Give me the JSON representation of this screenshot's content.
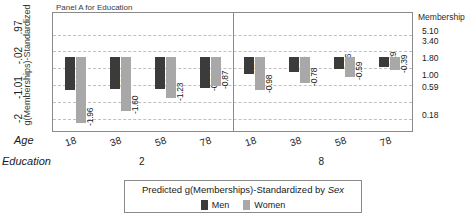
{
  "panel_title": "Panel A for Education",
  "axes": {
    "y_title": "g(Memberships)-Standardized",
    "y_ticks": [
      ".97",
      "-.02",
      "-1.01",
      "-2"
    ],
    "x_title": "Age",
    "group_title": "Education",
    "right_title": "Membership",
    "right_ticks": [
      "5.10",
      "3.40",
      "1.80",
      "1.00",
      "0.59",
      "0.18"
    ]
  },
  "legend": {
    "title_prefix": "Predicted g(Memberships)-Standardized by ",
    "title_emphasis": "Sex",
    "items": [
      {
        "label": "Men",
        "color": "#3b3b3b"
      },
      {
        "label": "Women",
        "color": "#a8a8a8"
      }
    ]
  },
  "chart_data": {
    "type": "bar",
    "title": "Panel A for Education",
    "xlabel": "Age",
    "ylabel": "g(Memberships)-Standardized",
    "ylim": [
      -2.2,
      1.3
    ],
    "grid": true,
    "legend_position": "bottom",
    "ytick_values": [
      0.97,
      -0.02,
      -1.01,
      -2
    ],
    "secondary_axis": {
      "label": "Membership",
      "ticks": [
        5.1,
        3.4,
        1.8,
        1.0,
        0.59,
        0.18
      ]
    },
    "groups": [
      "Education 2",
      "Education 8"
    ],
    "categories": [
      "18",
      "38",
      "58",
      "78"
    ],
    "series": [
      {
        "name": "Men",
        "color": "#3b3b3b",
        "values_by_group": [
          [
            -0.99,
            -0.96,
            -0.94,
            -0.91
          ],
          [
            -0.51,
            -0.44,
            -0.36,
            -0.29
          ]
        ]
      },
      {
        "name": "Women",
        "color": "#a8a8a8",
        "values_by_group": [
          [
            -1.96,
            -1.6,
            -1.23,
            -0.87
          ],
          [
            -0.98,
            -0.78,
            -0.59,
            -0.39
          ]
        ]
      }
    ],
    "bars": [
      {
        "group": "Education 2",
        "age": "18",
        "sex": "Men",
        "value": -0.99,
        "label": "-0.99"
      },
      {
        "group": "Education 2",
        "age": "18",
        "sex": "Women",
        "value": -1.96,
        "label": "-1.96"
      },
      {
        "group": "Education 2",
        "age": "38",
        "sex": "Men",
        "value": -0.96,
        "label": "-0.96"
      },
      {
        "group": "Education 2",
        "age": "38",
        "sex": "Women",
        "value": -1.6,
        "label": "-1.60"
      },
      {
        "group": "Education 2",
        "age": "58",
        "sex": "Men",
        "value": -0.94,
        "label": "-0.94"
      },
      {
        "group": "Education 2",
        "age": "58",
        "sex": "Women",
        "value": -1.23,
        "label": "-1.23"
      },
      {
        "group": "Education 2",
        "age": "78",
        "sex": "Men",
        "value": -0.91,
        "label": "-0.91"
      },
      {
        "group": "Education 2",
        "age": "78",
        "sex": "Women",
        "value": -0.87,
        "label": "-0.87"
      },
      {
        "group": "Education 8",
        "age": "18",
        "sex": "Men",
        "value": -0.51,
        "label": "-0.51"
      },
      {
        "group": "Education 8",
        "age": "18",
        "sex": "Women",
        "value": -0.98,
        "label": "-0.98"
      },
      {
        "group": "Education 8",
        "age": "38",
        "sex": "Men",
        "value": -0.44,
        "label": "-0.44"
      },
      {
        "group": "Education 8",
        "age": "38",
        "sex": "Women",
        "value": -0.78,
        "label": "-0.78"
      },
      {
        "group": "Education 8",
        "age": "58",
        "sex": "Men",
        "value": -0.36,
        "label": "-0.36"
      },
      {
        "group": "Education 8",
        "age": "58",
        "sex": "Women",
        "value": -0.59,
        "label": "-0.59"
      },
      {
        "group": "Education 8",
        "age": "78",
        "sex": "Men",
        "value": -0.29,
        "label": "-0.29"
      },
      {
        "group": "Education 8",
        "age": "78",
        "sex": "Women",
        "value": -0.39,
        "label": "-0.39"
      }
    ]
  }
}
